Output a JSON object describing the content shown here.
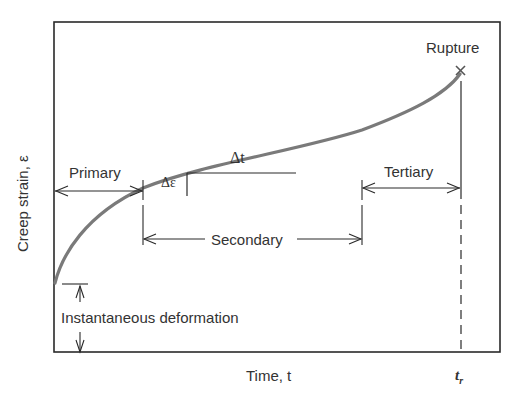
{
  "diagram": {
    "y_axis_label": "Creep strain, ε",
    "x_axis_label": "Time, t",
    "x_marker_label": "t_r",
    "x_marker_main": "t",
    "x_marker_sub": "r",
    "rupture_label": "Rupture",
    "rupture_marker": "×",
    "stages": [
      {
        "label": "Primary"
      },
      {
        "label": "Secondary"
      },
      {
        "label": "Tertiary"
      }
    ],
    "slope_labels": {
      "strain_increment": "Δε",
      "time_increment": "Δt"
    },
    "instantaneous_label": "Instantaneous deformation",
    "colors": {
      "curve": "#7a7a7a",
      "lines": "#2a2a2a",
      "background": "#ffffff"
    }
  }
}
